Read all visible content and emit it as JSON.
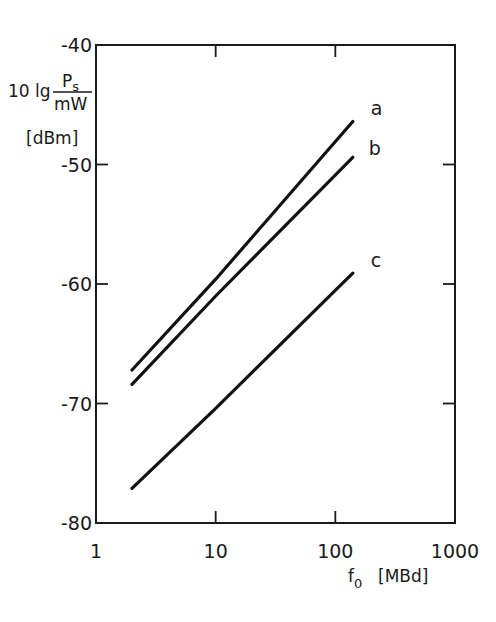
{
  "chart_data": {
    "type": "line",
    "title": "",
    "xlabel": "f0 [MBd]",
    "xlabel_main": "f",
    "xlabel_sub": "0",
    "xlabel_unit": "[MBd]",
    "ylabel": "10 lg Ps/mW [dBm]",
    "ylabel_prefix": "10 lg",
    "ylabel_num": "P",
    "ylabel_num_sub": "s",
    "ylabel_den": "mW",
    "ylabel_unit": "[dBm]",
    "xscale": "log",
    "xlim": [
      1,
      1000
    ],
    "ylim": [
      -80,
      -40
    ],
    "xticks": [
      "1",
      "10",
      "100",
      "1000"
    ],
    "yticks": [
      "-40",
      "-50",
      "-60",
      "-70",
      "-80"
    ],
    "grid": false,
    "legend": "inline labels at curve ends",
    "series": [
      {
        "name": "a",
        "x": [
          2,
          10,
          140
        ],
        "values": [
          -67.2,
          -59.6,
          -46.4
        ]
      },
      {
        "name": "b",
        "x": [
          2,
          10,
          140
        ],
        "values": [
          -68.4,
          -61.0,
          -49.4
        ]
      },
      {
        "name": "c",
        "x": [
          2,
          10,
          140
        ],
        "values": [
          -77.1,
          -70.4,
          -59.1
        ]
      }
    ]
  }
}
